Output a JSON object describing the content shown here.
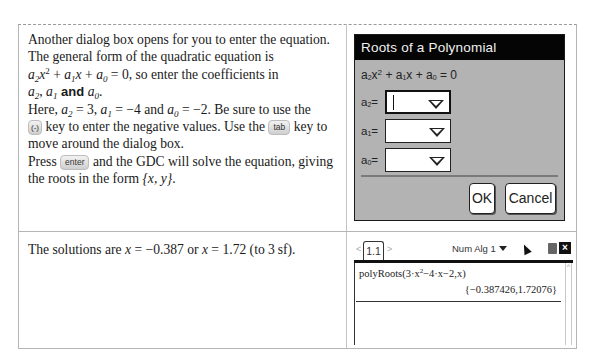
{
  "row1": {
    "text": {
      "line1": "Another dialog box opens for you to enter the equation.",
      "line2": "The general form of the quadratic equation is",
      "eq_a2": "a",
      "eq_a2_sub": "2",
      "eq_x": "x",
      "eq_x_sup": "2",
      "eq_plus1": " + ",
      "eq_a1": "a",
      "eq_a1_sub": "1",
      "eq_x1": "x",
      "eq_plus2": " + ",
      "eq_a0": "a",
      "eq_a0_sub": "0",
      "eq_rest": " = 0, so enter the coefficients in",
      "coef_a2": "a",
      "coef_a2_sub": "2",
      "coef_sep1": ", ",
      "coef_a1": "a",
      "coef_a1_sub": "1",
      "coef_and": " and ",
      "coef_a0": "a",
      "coef_a0_sub": "0",
      "coef_end": ".",
      "here_prefix": "Here, ",
      "here_a2": "a",
      "here_a2_sub": "2",
      "here_a2_val": " = 3, ",
      "here_a1": "a",
      "here_a1_sub": "1",
      "here_a1_val": " = −4 and ",
      "here_a0": "a",
      "here_a0_sub": "0",
      "here_a0_val": " = −2. Be sure to use the",
      "neg_key": "(-)",
      "neg_after": " key to enter the negative values. Use the ",
      "tab_key": "tab",
      "tab_after": " key to",
      "line_move": "move around the dialog box.",
      "press": "Press ",
      "enter_key": "enter",
      "press_after": " and the GDC will solve the equation, giving",
      "roots_line": "the roots in the form ",
      "roots_form": "{x, y}",
      "roots_end": "."
    },
    "dialog": {
      "title": "Roots of a Polynomial",
      "equation": {
        "a2": "a",
        "a2_sub": "2",
        "x2": "x",
        "x2_sup": "2",
        "plus1": " + ",
        "a1": "a",
        "a1_sub": "1",
        "x1": "x",
        "plus2": " + ",
        "a0": "a",
        "a0_sub": "0",
        "eq": " = 0"
      },
      "fields": [
        {
          "label": "a",
          "sub": "2",
          "suffix": "=",
          "value": ""
        },
        {
          "label": "a",
          "sub": "1",
          "suffix": "=",
          "value": ""
        },
        {
          "label": "a",
          "sub": "0",
          "suffix": "=",
          "value": ""
        }
      ],
      "ok_label": "OK",
      "cancel_label": "Cancel"
    }
  },
  "row2": {
    "text": {
      "prefix": "The solutions are ",
      "x1": "x",
      "eq1": " = −0.387 or ",
      "x2": "x",
      "eq2": " = 1.72 (to 3 sf)."
    },
    "calculator": {
      "tab_label": "1.1",
      "doc_name": "Num Alg 1",
      "entry_prefix": "polyRoots(3·x",
      "entry_sup": "2",
      "entry_suffix": "−4·x−2,x)",
      "result": "{−0.387426,1.72076}",
      "close_icon": "×"
    }
  }
}
